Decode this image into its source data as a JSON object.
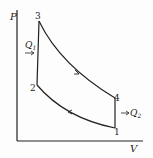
{
  "diagram": {
    "type": "P-V cycle diagram (Otto cycle)",
    "axes": {
      "y_label": "P",
      "x_label": "V"
    },
    "points": [
      {
        "id": "1",
        "label": "1"
      },
      {
        "id": "2",
        "label": "2"
      },
      {
        "id": "3",
        "label": "3"
      },
      {
        "id": "4",
        "label": "4"
      }
    ],
    "heat": {
      "in_label": "Q",
      "in_sub": "1",
      "out_label": "Q",
      "out_sub": "2"
    },
    "colors": {
      "line": "#222222",
      "background": "#fdfdfd"
    }
  }
}
